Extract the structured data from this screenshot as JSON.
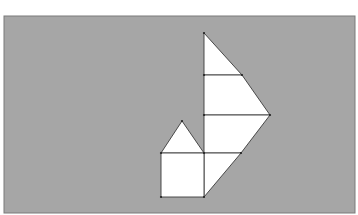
{
  "diagram": {
    "colors": {
      "page_background": "#ffffff",
      "panel_fill": "#a6a6a6",
      "panel_border": "#7a7a7a",
      "shape_fill": "#ffffff",
      "shape_stroke": "#3a3a3a"
    },
    "panel": {
      "x": 4,
      "y": 16,
      "width": 351,
      "height": 197
    },
    "shapes": {
      "sail_top_triangle": "204,33 242,75 204,75",
      "sail_upper_trapezoid": "204,75 242,75 270,115 204,115",
      "sail_lower_trapezoid": "204,115 270,115 241,153 204,153",
      "hull_triangle": "204,153 241,153 204,197",
      "house_roof": "161,153 182,121 204,153",
      "house_body": "161,153 204,153 204,197 161,197"
    },
    "vertices": [
      [
        204,
        33
      ],
      [
        204,
        75
      ],
      [
        242,
        75
      ],
      [
        204,
        115
      ],
      [
        270,
        115
      ],
      [
        204,
        153
      ],
      [
        241,
        153
      ],
      [
        161,
        153
      ],
      [
        182,
        121
      ],
      [
        161,
        197
      ],
      [
        204,
        197
      ]
    ]
  }
}
